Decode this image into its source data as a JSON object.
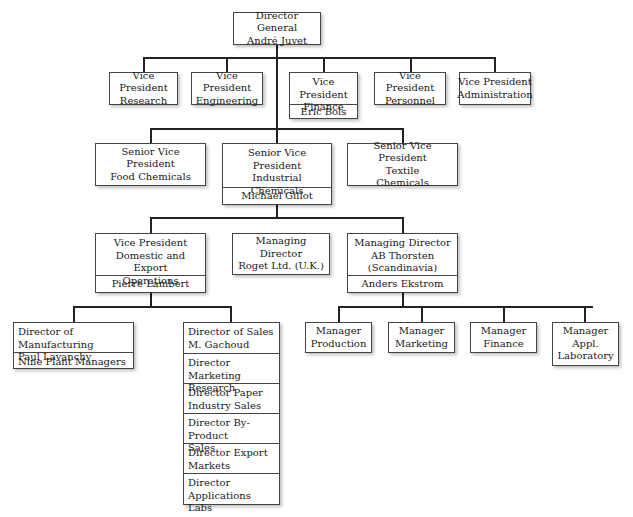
{
  "chart": {
    "level0": {
      "director_general": {
        "title": "Director General",
        "name": "André Juvet"
      }
    },
    "level1_vice_presidents": [
      {
        "title": "Vice President",
        "dept": "Research"
      },
      {
        "title": "Vice President",
        "dept": "Engineering"
      },
      {
        "title": "Vice President",
        "dept": "Finance",
        "name": "Eric Bols"
      },
      {
        "title": "Vice President",
        "dept": "Personnel"
      },
      {
        "title": "Vice President",
        "dept": "Administration"
      }
    ],
    "level2_senior_vps": [
      {
        "title": "Senior Vice President",
        "line2": "Food Chemicals"
      },
      {
        "title": "Senior Vice President",
        "line2": "Industrial",
        "line3": "Chemicals",
        "name": "Michael Gillot"
      },
      {
        "title": "Senior Vice President",
        "line2": "Textile",
        "line3": "Chemicals"
      }
    ],
    "level3": [
      {
        "title": "Vice President",
        "line2": "Domestic and Export",
        "line3": "Operations",
        "name": "Pierre Lambert"
      },
      {
        "title": "Managing Director",
        "line2": "Roget Ltd. (U.K.)"
      },
      {
        "title": "Managing Director",
        "line2": "AB Thorsten",
        "line3": "(Scandinavia)",
        "name": "Anders Ekstrom"
      }
    ],
    "manufacturing": {
      "line1": "Director of Manufacturing",
      "line2": "Paul Lavanchy",
      "sub": "Nine Plant Managers"
    },
    "sales_stack": [
      {
        "line1": "Director of Sales",
        "line2": "M. Gachoud"
      },
      {
        "line1": "Director Marketing",
        "line2": "Research"
      },
      {
        "line1": "Director Paper",
        "line2": "Industry Sales"
      },
      {
        "line1": "Director By-Product",
        "line2": "Sales"
      },
      {
        "line1": "Director Export",
        "line2": "Markets"
      },
      {
        "line1": "Director",
        "line2": "Applications Labs"
      }
    ],
    "managers": [
      {
        "line1": "Manager",
        "line2": "Production"
      },
      {
        "line1": "Manager",
        "line2": "Marketing"
      },
      {
        "line1": "Manager",
        "line2": "Finance"
      },
      {
        "line1": "Manager",
        "line2": "Appl.",
        "line3": "Laboratory"
      }
    ]
  }
}
